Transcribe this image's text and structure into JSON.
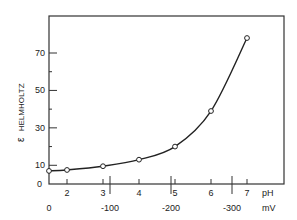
{
  "chart_data": {
    "type": "line",
    "title": "",
    "xlabel": "pH",
    "x2label": "mV",
    "ylabel": "ε HELMHOLTZ",
    "ylabel_symbol": "ε",
    "ylabel_text": "HELMHOLTZ",
    "x": [
      1.5,
      2,
      3,
      4,
      5,
      6,
      7
    ],
    "series": [
      {
        "name": "ε Helmholtz",
        "values": [
          7,
          7.5,
          9.5,
          13,
          20,
          39,
          78
        ],
        "marker": "open-circle",
        "line": "smooth"
      }
    ],
    "xlim": [
      1.5,
      8.5
    ],
    "ylim": [
      0,
      90
    ],
    "x_ticks": [
      2,
      3,
      4,
      5,
      6,
      7
    ],
    "x_tick_labels": [
      "2",
      "3",
      "4",
      "5",
      "6",
      "7"
    ],
    "x2_ticks": [
      0,
      -100,
      -200,
      -300
    ],
    "x2_tick_labels": [
      "0",
      "-100",
      "-200",
      "-300"
    ],
    "y_ticks_labeled": [
      0,
      10,
      30,
      50,
      70
    ],
    "y_tick_labels": [
      "0",
      "10",
      "30",
      "50",
      "70"
    ],
    "y_ticks_minor": [
      20,
      40,
      60
    ],
    "grid": false,
    "legend": null,
    "colors": {
      "line": "#222222",
      "frame": "#333333"
    }
  }
}
